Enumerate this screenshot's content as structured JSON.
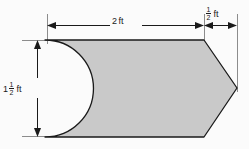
{
  "figure": {
    "background_color": "#fbfbfb",
    "shape": {
      "name": "pointed block with semicircular notch",
      "fill_color": "#c9c9c9",
      "stroke_color": "#1a1a1a",
      "body_left_x": 45,
      "body_right_x": 204,
      "top_y": 40,
      "bottom_y": 137,
      "notch_radius": 48,
      "notch_center_x": 45,
      "notch_center_y": 88,
      "notch_apex_x": 88,
      "point_tip_x": 237,
      "point_tip_y": 88
    },
    "dimensions": [
      {
        "name": "body-width",
        "orientation": "horizontal",
        "whole": "2",
        "numerator": "",
        "denominator": "",
        "unit": "ft",
        "text": "2 ft",
        "from_x": 47,
        "to_x": 204,
        "line_y": 25
      },
      {
        "name": "point-length",
        "orientation": "horizontal",
        "whole": "",
        "numerator": "1",
        "denominator": "2",
        "unit": "ft",
        "text": "1/2 ft",
        "from_x": 204,
        "to_x": 237,
        "line_y": 25
      },
      {
        "name": "overall-height",
        "orientation": "vertical",
        "whole": "1",
        "numerator": "1",
        "denominator": "2",
        "unit": "ft",
        "text": "1 1/2 ft",
        "from_y": 40,
        "to_y": 137,
        "line_x": 37
      }
    ]
  }
}
